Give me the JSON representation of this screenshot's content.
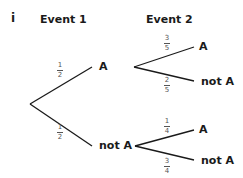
{
  "diagram": {
    "part_label": "i",
    "headers": {
      "event1": "Event 1",
      "event2": "Event 2"
    },
    "level1": [
      {
        "label": "A",
        "prob_num": "1",
        "prob_den": "2"
      },
      {
        "label": "not A",
        "prob_num": "1",
        "prob_den": "2"
      }
    ],
    "level2": {
      "from_A": [
        {
          "label": "A",
          "prob_num": "3",
          "prob_den": "5"
        },
        {
          "label": "not A",
          "prob_num": "2",
          "prob_den": "5"
        }
      ],
      "from_notA": [
        {
          "label": "A",
          "prob_num": "1",
          "prob_den": "4"
        },
        {
          "label": "not A",
          "prob_num": "3",
          "prob_den": "4"
        }
      ]
    },
    "line_color": "#1a1a1a"
  }
}
